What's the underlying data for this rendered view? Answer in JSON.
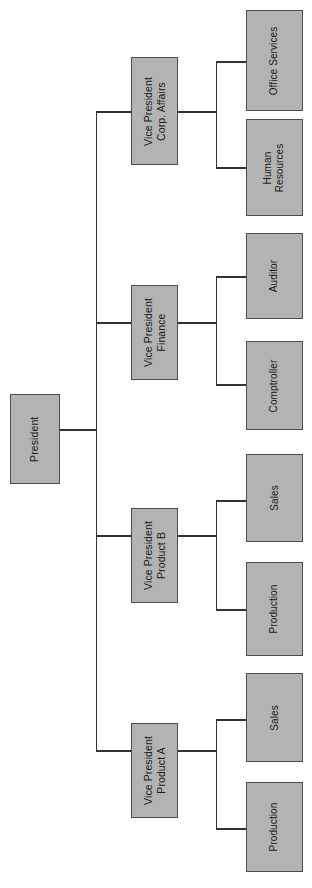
{
  "diagram": {
    "type": "organization-chart",
    "orientation": "rotated-90-counterclockwise",
    "box_fill_color": "#b3b3b3",
    "box_border_color": "#4d4d4d",
    "connector_color": "#333333",
    "background_color": "#ffffff",
    "root": {
      "id": "president",
      "label": "President"
    },
    "level2": [
      {
        "id": "vp-corp-affairs",
        "label": "Vice President\nCorp. Affairs"
      },
      {
        "id": "vp-finance",
        "label": "Vice President\nFinance"
      },
      {
        "id": "vp-product-b",
        "label": "Vice President\nProduct B"
      },
      {
        "id": "vp-product-a",
        "label": "Vice President\nProduct A"
      }
    ],
    "level3": [
      {
        "id": "office-services",
        "label": "Office Services",
        "parent": "vp-corp-affairs"
      },
      {
        "id": "human-resources",
        "label": "Human\nResources",
        "parent": "vp-corp-affairs"
      },
      {
        "id": "auditor",
        "label": "Auditor",
        "parent": "vp-finance"
      },
      {
        "id": "comptroller",
        "label": "Comptroller",
        "parent": "vp-finance"
      },
      {
        "id": "sales-b",
        "label": "Sales",
        "parent": "vp-product-b"
      },
      {
        "id": "production-b",
        "label": "Production",
        "parent": "vp-product-b"
      },
      {
        "id": "sales-a",
        "label": "Sales",
        "parent": "vp-product-a"
      },
      {
        "id": "production-a",
        "label": "Production",
        "parent": "vp-product-a"
      }
    ]
  }
}
